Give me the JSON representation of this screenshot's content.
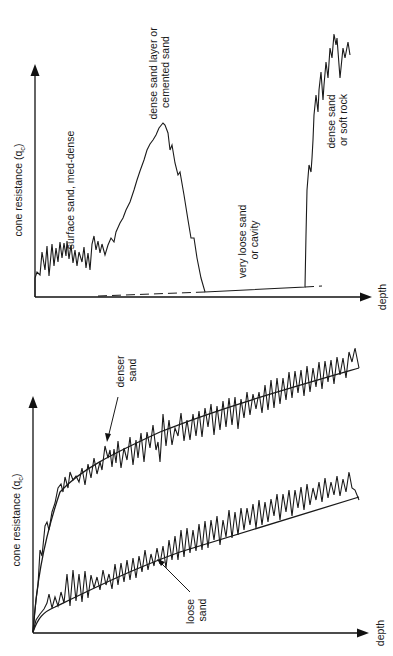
{
  "figure": {
    "panels": [
      {
        "id": "top",
        "description": "Cone resistance profile with layered soils",
        "y_axis_label": "cone resistance (q",
        "y_axis_subscript": "c",
        "y_axis_label_close": ")",
        "x_axis_label": "depth",
        "annotations": [
          {
            "id": "surface",
            "lines": [
              "surface sand, med-dense"
            ]
          },
          {
            "id": "dense_layer",
            "lines": [
              "dense sand layer or",
              "cemented sand"
            ]
          },
          {
            "id": "cavity",
            "lines": [
              "very loose sand",
              "or cavity"
            ]
          },
          {
            "id": "rock",
            "lines": [
              "dense sand",
              "or soft rock"
            ]
          }
        ]
      },
      {
        "id": "bottom",
        "description": "Cone resistance increasing with depth for loose and denser sand",
        "y_axis_label": "cone resistance (q",
        "y_axis_subscript": "c",
        "y_axis_label_close": ")",
        "x_axis_label": "depth",
        "annotations": [
          {
            "id": "denser",
            "lines": [
              "denser",
              "sand"
            ]
          },
          {
            "id": "loose",
            "lines": [
              "loose",
              "sand"
            ]
          }
        ]
      }
    ],
    "colors": {
      "ink": "#1a1a1a",
      "background": "#ffffff"
    }
  }
}
